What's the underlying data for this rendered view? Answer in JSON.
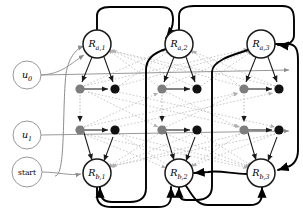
{
  "diagram": {
    "type": "state-transition-graph",
    "colors": {
      "node_stroke_dark": "#1a1a1a",
      "node_stroke_light": "#9a9a9a",
      "dot_black": "#111111",
      "dot_gray": "#7d7d7d",
      "edge_thick": "#000000",
      "edge_thin": "#8c8c8c",
      "edge_dotted": "#b5b5b5",
      "background": "#ffffff",
      "label": "#000000"
    },
    "input_nodes": [
      {
        "id": "u0",
        "label": "u",
        "sub": "0",
        "cx": 27,
        "cy": 75,
        "r": 14
      },
      {
        "id": "u1",
        "label": "u",
        "sub": "1",
        "cx": 27,
        "cy": 135,
        "r": 14
      },
      {
        "id": "start",
        "label": "start",
        "sub": "",
        "cx": 27,
        "cy": 172,
        "r": 15
      }
    ],
    "state_nodes": [
      {
        "id": "Ra1",
        "label": "R",
        "sub": "a,1",
        "cx": 97,
        "cy": 44,
        "r": 14
      },
      {
        "id": "Ra2",
        "label": "R",
        "sub": "a,2",
        "cx": 179,
        "cy": 44,
        "r": 14
      },
      {
        "id": "Ra3",
        "label": "R",
        "sub": "a,3",
        "cx": 261,
        "cy": 44,
        "r": 14
      },
      {
        "id": "Rb1",
        "label": "R",
        "sub": "b,1",
        "cx": 97,
        "cy": 173,
        "r": 14
      },
      {
        "id": "Rb2",
        "label": "R",
        "sub": "b,2",
        "cx": 179,
        "cy": 173,
        "r": 14
      },
      {
        "id": "Rb3",
        "label": "R",
        "sub": "b,3",
        "cx": 261,
        "cy": 173,
        "r": 14
      }
    ],
    "dot_nodes": [
      {
        "id": "d11",
        "cx": 80,
        "cy": 89,
        "shade": "gray"
      },
      {
        "id": "d12",
        "cx": 115,
        "cy": 89,
        "shade": "black"
      },
      {
        "id": "d13",
        "cx": 80,
        "cy": 130,
        "shade": "gray"
      },
      {
        "id": "d14",
        "cx": 115,
        "cy": 130,
        "shade": "black"
      },
      {
        "id": "d21",
        "cx": 162,
        "cy": 89,
        "shade": "gray"
      },
      {
        "id": "d22",
        "cx": 197,
        "cy": 89,
        "shade": "black"
      },
      {
        "id": "d23",
        "cx": 162,
        "cy": 130,
        "shade": "gray"
      },
      {
        "id": "d24",
        "cx": 197,
        "cy": 130,
        "shade": "black"
      },
      {
        "id": "d31",
        "cx": 244,
        "cy": 89,
        "shade": "gray"
      },
      {
        "id": "d32",
        "cx": 279,
        "cy": 89,
        "shade": "black"
      },
      {
        "id": "d33",
        "cx": 244,
        "cy": 130,
        "shade": "gray"
      },
      {
        "id": "d34",
        "cx": 279,
        "cy": 130,
        "shade": "black"
      }
    ],
    "dot_radius": 4.6,
    "columns": 3,
    "rows": 2
  }
}
